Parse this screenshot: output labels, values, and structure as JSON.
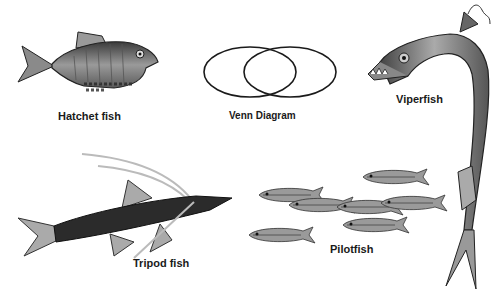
{
  "labels": {
    "hatchet": "Hatchet fish",
    "venn": "Venn Diagram",
    "viper": "Viperfish",
    "tripod": "Tripod fish",
    "pilot": "Pilotfish"
  },
  "colors": {
    "ink": "#1a1a1a",
    "fish_dark": "#2b2b2b",
    "fish_mid": "#7a7a7a",
    "fish_light": "#bdbdbd",
    "background": "#ffffff"
  },
  "venn": {
    "circles": 2,
    "stroke": "#1a1a1a"
  }
}
